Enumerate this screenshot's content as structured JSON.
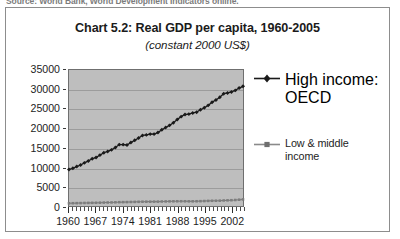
{
  "source_caption": "Source: World Bank, World Development Indicators online.",
  "chart_data": {
    "type": "line",
    "title": "Chart 5.2:  Real GDP per capita, 1960-2005",
    "subtitle": "(constant 2000 US$)",
    "xlabel": "",
    "ylabel": "",
    "xlim": [
      1960,
      2005
    ],
    "ylim": [
      0,
      35000
    ],
    "grid": true,
    "legend_position": "right",
    "ytick_labels": [
      "35000",
      "30000",
      "25000",
      "20000",
      "15000",
      "10000",
      "5000",
      "0"
    ],
    "ytick_values": [
      35000,
      30000,
      25000,
      20000,
      15000,
      10000,
      5000,
      0
    ],
    "xtick_labels": [
      "1960",
      "1967",
      "1974",
      "1981",
      "1988",
      "1995",
      "2002"
    ],
    "xtick_values": [
      1960,
      1967,
      1974,
      1981,
      1988,
      1995,
      2002
    ],
    "x": [
      1960,
      1961,
      1962,
      1963,
      1964,
      1965,
      1966,
      1967,
      1968,
      1969,
      1970,
      1971,
      1972,
      1973,
      1974,
      1975,
      1976,
      1977,
      1978,
      1979,
      1980,
      1981,
      1982,
      1983,
      1984,
      1985,
      1986,
      1987,
      1988,
      1989,
      1990,
      1991,
      1992,
      1993,
      1994,
      1995,
      1996,
      1997,
      1998,
      1999,
      2000,
      2001,
      2002,
      2003,
      2004,
      2005
    ],
    "series": [
      {
        "name": "High income: OECD",
        "marker": "diamond",
        "color": "#1a1a1a",
        "values": [
          9400,
          9700,
          10150,
          10550,
          11100,
          11600,
          12150,
          12500,
          13100,
          13700,
          14050,
          14450,
          15050,
          15800,
          15800,
          15700,
          16350,
          16900,
          17500,
          18150,
          18300,
          18500,
          18500,
          18900,
          19600,
          20200,
          20750,
          21400,
          22250,
          23000,
          23550,
          23650,
          23950,
          24150,
          24750,
          25300,
          25900,
          26700,
          27300,
          28000,
          28900,
          29100,
          29350,
          29750,
          30350,
          30800
        ]
      },
      {
        "name": "Low & middle income",
        "marker": "square",
        "color": "#7d7d7d",
        "values": [
          700,
          720,
          735,
          750,
          780,
          795,
          815,
          830,
          855,
          880,
          905,
          920,
          945,
          985,
          1000,
          1010,
          1040,
          1060,
          1085,
          1105,
          1115,
          1115,
          1125,
          1130,
          1160,
          1175,
          1190,
          1205,
          1215,
          1220,
          1215,
          1200,
          1205,
          1220,
          1245,
          1275,
          1310,
          1345,
          1355,
          1375,
          1425,
          1455,
          1490,
          1545,
          1625,
          1700
        ]
      }
    ]
  },
  "legend": {
    "entries": [
      {
        "label": "High income: OECD",
        "label_line2": ""
      },
      {
        "label": "Low & middle",
        "label_line2": "income"
      }
    ]
  },
  "colors": {
    "plot_background": "#bebebe",
    "grid_line": "#9c9c9c",
    "series_primary": "#1a1a1a",
    "series_secondary": "#7d7d7d",
    "frame": "#8d8d8d",
    "text": "#1d1d1d"
  }
}
